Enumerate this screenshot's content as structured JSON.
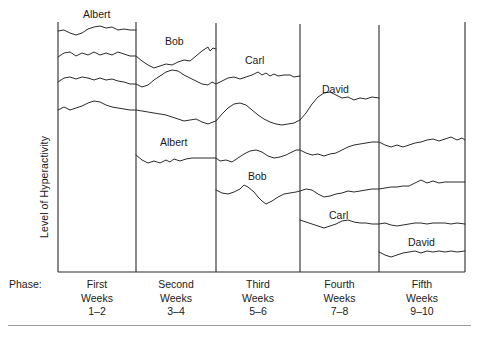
{
  "figure": {
    "y_axis_label": "Level of Hyperactivity",
    "phase_row_label": "Phase:"
  },
  "phases": [
    {
      "ordinal": "First",
      "unit": "Weeks",
      "range": "1–2",
      "x_start": 58,
      "x_end": 136
    },
    {
      "ordinal": "Second",
      "unit": "Weeks",
      "range": "3–4",
      "x_start": 136,
      "x_end": 216
    },
    {
      "ordinal": "Third",
      "unit": "Weeks",
      "range": "5–6",
      "x_start": 216,
      "x_end": 300
    },
    {
      "ordinal": "Fourth",
      "unit": "Weeks",
      "range": "7–8",
      "x_start": 300,
      "x_end": 379
    },
    {
      "ordinal": "Fifth",
      "unit": "Weeks",
      "range": "9–10",
      "x_start": 379,
      "x_end": 465
    }
  ],
  "series_tags": [
    {
      "label": "Albert",
      "x": 83,
      "y": 8,
      "name": "series-tag-albert-baseline"
    },
    {
      "label": "Bob",
      "x": 165,
      "y": 35,
      "name": "series-tag-bob-baseline"
    },
    {
      "label": "Carl",
      "x": 245,
      "y": 54,
      "name": "series-tag-carl-baseline"
    },
    {
      "label": "David",
      "x": 322,
      "y": 83,
      "name": "series-tag-david-baseline"
    },
    {
      "label": "Albert",
      "x": 160,
      "y": 136,
      "name": "series-tag-albert-treatment"
    },
    {
      "label": "Bob",
      "x": 248,
      "y": 170,
      "name": "series-tag-bob-treatment"
    },
    {
      "label": "Carl",
      "x": 329,
      "y": 209,
      "name": "series-tag-carl-treatment"
    },
    {
      "label": "David",
      "x": 408,
      "y": 236,
      "name": "series-tag-david-treatment"
    }
  ],
  "chart_data": {
    "type": "line",
    "title": "",
    "xlabel": "Phase",
    "ylabel": "Level of Hyperactivity",
    "grid": false,
    "legend": "inline-labels",
    "design": "multiple-baseline-across-subjects",
    "x_tick_labels": [
      "First Weeks 1–2",
      "Second Weeks 3–4",
      "Third Weeks 5–6",
      "Fourth Weeks 7–8",
      "Fifth Weeks 9–10"
    ],
    "x_axis_weeks": [
      1,
      2,
      3,
      4,
      5,
      6,
      7,
      8,
      9,
      10
    ],
    "y_axis_note": "Unscaled ordinal axis; higher is more hyperactive",
    "series": [
      {
        "name": "Albert baseline",
        "subject": "Albert",
        "condition": "baseline",
        "phases": [
          "First"
        ],
        "path": "M58,31 L64,30 L70,33 L76,35 L82,33 L88,29 L94,27 L100,26 L106,28 L112,27 L118,30 L124,29 L130,30 L136,30"
      },
      {
        "name": "Bob baseline",
        "subject": "Bob",
        "condition": "baseline",
        "phases": [
          "First",
          "Second"
        ],
        "path": "M58,57 L64,53 L70,52 L76,56 L82,53 L88,55 L94,52 L100,55 L106,53 L112,55 L118,52 L124,54 L130,56 L136,56 L142,61 L148,65 L154,68 L160,66 L166,64 L172,65 L178,62 L184,60 L190,61 L196,56 L202,51 L208,47 L210,51 L213,48 L216,49"
      },
      {
        "name": "Carl baseline",
        "subject": "Carl",
        "condition": "baseline",
        "phases": [
          "First",
          "Second",
          "Third"
        ],
        "path": "M58,82 L64,78 L70,77 L76,79 L82,77 L88,78 L94,80 L100,78 L106,80 L112,79 L118,81 L124,82 L130,84 L136,84 L142,87 L148,85 L154,80 L160,76 L166,72 L172,70 L178,71 L184,75 L190,78 L196,81 L202,84 L208,85 L212,82 L216,84 L222,81 L228,78 L234,77 L240,79 L246,77 L252,75 L258,72 L262,75 L266,73 L270,76 L274,74 L278,76 L284,75 L290,75 L294,77 L300,76"
      },
      {
        "name": "David baseline",
        "subject": "David",
        "condition": "baseline",
        "phases": [
          "First",
          "Second",
          "Third",
          "Fourth"
        ],
        "path": "M58,110 L64,107 L70,110 L76,108 L82,106 L88,103 L94,101 L100,102 L106,105 L112,107 L118,108 L124,109 L130,110 L136,110 L142,111 L148,112 L154,113 L160,114 L166,115 L172,117 L178,119 L184,121 L190,120 L196,119 L202,122 L208,124 L213,122 L216,121 L222,114 L228,108 L234,104 L240,103 L246,105 L252,110 L258,115 L264,119 L270,122 L276,124 L282,125 L288,124 L294,123 L300,120 L306,113 L312,104 L318,97 L324,93 L330,92 L336,95 L342,98 L348,97 L354,100 L360,98 L366,99 L372,97 L379,98"
      },
      {
        "name": "Albert treatment",
        "subject": "Albert",
        "condition": "treatment",
        "phases": [
          "Second",
          "Third",
          "Fourth",
          "Fifth"
        ],
        "path": "M136,155 L142,160 L148,163 L154,161 L160,163 L166,160 L170,162 L174,159 L180,161 L186,159 L192,158 L198,158 L204,158 L210,158 L216,158 L220,161 L226,160 L232,162 L238,158 L244,154 L250,151 L256,150 L262,152 L268,156 L274,158 L280,157 L286,155 L292,152 L296,150 L300,150 L306,153 L312,155 L318,154 L324,156 L330,154 L336,153 L342,150 L348,147 L354,145 L360,144 L366,143 L372,142 L379,142 L385,145 L391,147 L397,145 L403,147 L409,145 L415,143 L421,142 L427,140 L433,139 L439,141 L445,139 L451,137 L457,140 L462,138 L465,140"
      },
      {
        "name": "Bob treatment",
        "subject": "Bob",
        "condition": "treatment",
        "phases": [
          "Third",
          "Fourth",
          "Fifth"
        ],
        "path": "M216,190 L222,193 L228,194 L234,192 L240,189 L244,185 L248,187 L254,192 L258,197 L262,201 L266,204 L272,201 L278,197 L284,194 L290,193 L296,192 L300,191 L306,189 L312,190 L318,194 L324,197 L330,196 L336,194 L342,193 L348,191 L354,192 L360,191 L366,190 L372,189 L379,189 L385,188 L391,187 L397,187 L403,186 L409,186 L415,183 L421,180 L427,183 L433,181 L439,183 L445,182 L451,182 L457,182 L465,182"
      },
      {
        "name": "Carl treatment",
        "subject": "Carl",
        "condition": "treatment",
        "phases": [
          "Fourth",
          "Fifth"
        ],
        "path": "M300,220 L306,222 L312,224 L318,226 L324,228 L330,226 L336,224 L342,221 L348,220 L354,222 L360,223 L366,223 L372,224 L379,224 L385,223 L391,225 L397,226 L403,225 L409,224 L415,223 L421,223 L427,224 L433,223 L439,223 L445,223 L451,224 L457,223 L465,224"
      },
      {
        "name": "David treatment",
        "subject": "David",
        "condition": "treatment",
        "phases": [
          "Fifth"
        ],
        "path": "M379,252 L385,255 L391,257 L397,255 L403,253 L409,252 L415,251 L421,253 L427,251 L433,252 L439,251 L445,252 L451,251 L457,252 L465,251"
      }
    ]
  }
}
